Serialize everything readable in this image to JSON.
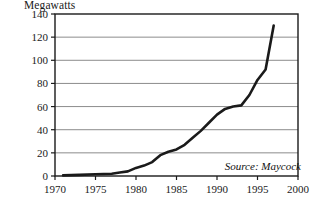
{
  "chart_data": {
    "type": "line",
    "title": "Megawatts",
    "xlabel": "",
    "ylabel": "Megawatts",
    "xlim": [
      1970,
      2000
    ],
    "ylim": [
      0,
      140
    ],
    "grid": true,
    "legend": null,
    "annotations": [
      {
        "name": "source",
        "text": "Source: Maycock"
      }
    ],
    "xticks": [
      1970,
      1975,
      1980,
      1985,
      1990,
      1995,
      2000
    ],
    "xtick_labels": [
      "1970",
      "1975",
      "1980",
      "1985",
      "1990",
      "1995",
      "2000"
    ],
    "yticks": [
      0,
      20,
      40,
      60,
      80,
      100,
      120,
      140
    ],
    "ytick_labels": [
      "0",
      "20",
      "40",
      "60",
      "80",
      "100",
      "120",
      "140"
    ],
    "series": [
      {
        "name": "World photovoltaic shipments",
        "color": "#1a1a1a",
        "x": [
          1971,
          1973,
          1975,
          1977,
          1978,
          1979,
          1980,
          1981,
          1982,
          1983,
          1984,
          1985,
          1986,
          1987,
          1988,
          1989,
          1990,
          1991,
          1992,
          1993,
          1994,
          1995,
          1996,
          1997
        ],
        "values": [
          0.5,
          1,
          1.5,
          2,
          3,
          4,
          7,
          9,
          12,
          18,
          21,
          23,
          27,
          33,
          39,
          46,
          53,
          58,
          60,
          61,
          70,
          83,
          92,
          130
        ]
      }
    ]
  },
  "axis": {
    "x_tick_count": 7,
    "y_tick_count": 8
  }
}
